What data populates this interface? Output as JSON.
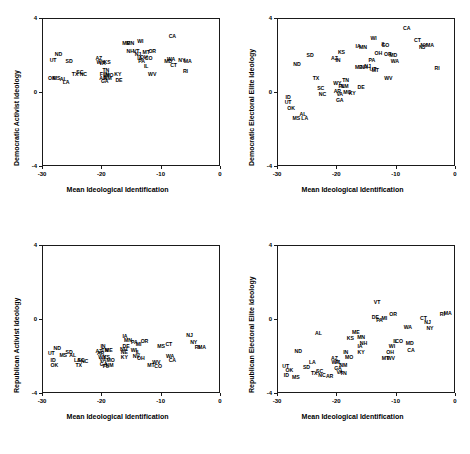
{
  "figure": {
    "panel_count": 4,
    "shared_xlabel": "Mean Ideological Identification",
    "xticks": [
      "-30",
      "-20",
      "-10",
      "0"
    ],
    "yticks": [
      "4",
      "0",
      "-4"
    ]
  },
  "chart_data": [
    {
      "id": "panel-top-left",
      "type": "scatter",
      "title": "",
      "xlabel": "Mean Ideological Identification",
      "ylabel": "Democratic Activist Ideology",
      "xlim": [
        -30,
        0
      ],
      "ylim": [
        -4,
        4
      ],
      "xticks": [
        -30,
        -20,
        -10,
        0
      ],
      "yticks": [
        4,
        0,
        -4
      ],
      "grid": false,
      "legend": "none",
      "point_labels": "state abbreviations",
      "points": [
        {
          "label": "UT",
          "x": -28.3,
          "y": 1.75
        },
        {
          "label": "ND",
          "x": -27.4,
          "y": 2.05
        },
        {
          "label": "SD",
          "x": -25.6,
          "y": 1.65
        },
        {
          "label": "OK",
          "x": -28.5,
          "y": 0.75
        },
        {
          "label": "MS",
          "x": -27.7,
          "y": 0.75
        },
        {
          "label": "AL",
          "x": -26.6,
          "y": 0.7
        },
        {
          "label": "LA",
          "x": -26.1,
          "y": 0.55
        },
        {
          "label": "TX",
          "x": -24.6,
          "y": 0.95
        },
        {
          "label": "SC",
          "x": -23.8,
          "y": 1.1
        },
        {
          "label": "NC",
          "x": -23.2,
          "y": 0.95
        },
        {
          "label": "AZ",
          "x": -20.6,
          "y": 1.85
        },
        {
          "label": "WY",
          "x": -20.3,
          "y": 1.6
        },
        {
          "label": "VA",
          "x": -20.0,
          "y": 1.55
        },
        {
          "label": "KS",
          "x": -19.2,
          "y": 1.6
        },
        {
          "label": "TN",
          "x": -19.4,
          "y": 1.2
        },
        {
          "label": "FL",
          "x": -19.9,
          "y": 1.0
        },
        {
          "label": "IN",
          "x": -19.3,
          "y": 0.95
        },
        {
          "label": "MO",
          "x": -18.8,
          "y": 0.9
        },
        {
          "label": "AR",
          "x": -19.9,
          "y": 0.75
        },
        {
          "label": "NM",
          "x": -19.1,
          "y": 0.75
        },
        {
          "label": "GA",
          "x": -19.6,
          "y": 0.6
        },
        {
          "label": "KY",
          "x": -17.4,
          "y": 0.95
        },
        {
          "label": "DE",
          "x": -17.2,
          "y": 0.65
        },
        {
          "label": "ME",
          "x": -16.0,
          "y": 2.65
        },
        {
          "label": "MN",
          "x": -15.3,
          "y": 2.65
        },
        {
          "label": "WI",
          "x": -13.6,
          "y": 2.75
        },
        {
          "label": "NH",
          "x": -15.3,
          "y": 2.2
        },
        {
          "label": "VT",
          "x": -14.3,
          "y": 2.2
        },
        {
          "label": "NJ",
          "x": -14.0,
          "y": 2.05
        },
        {
          "label": "IA",
          "x": -13.7,
          "y": 1.85
        },
        {
          "label": "PA",
          "x": -13.4,
          "y": 1.7
        },
        {
          "label": "MT",
          "x": -12.6,
          "y": 2.15
        },
        {
          "label": "OH",
          "x": -13.0,
          "y": 1.9
        },
        {
          "label": "CO",
          "x": -12.2,
          "y": 1.85
        },
        {
          "label": "IL",
          "x": -12.6,
          "y": 1.4
        },
        {
          "label": "OR",
          "x": -11.6,
          "y": 2.2
        },
        {
          "label": "WV",
          "x": -11.6,
          "y": 0.95
        },
        {
          "label": "CA",
          "x": -8.2,
          "y": 3.05
        },
        {
          "label": "WA",
          "x": -8.4,
          "y": 1.8
        },
        {
          "label": "MD",
          "x": -8.9,
          "y": 1.7
        },
        {
          "label": "CT",
          "x": -8.0,
          "y": 1.45
        },
        {
          "label": "NY",
          "x": -6.6,
          "y": 1.75
        },
        {
          "label": "MA",
          "x": -5.6,
          "y": 1.7
        },
        {
          "label": "RI",
          "x": -6.0,
          "y": 1.15
        }
      ]
    },
    {
      "id": "panel-top-right",
      "type": "scatter",
      "title": "",
      "xlabel": "Mean Ideological Identification",
      "ylabel": "Democratic Electoral Elite Ideology",
      "xlim": [
        -30,
        0
      ],
      "ylim": [
        -4,
        4
      ],
      "xticks": [
        -30,
        -20,
        -10,
        0
      ],
      "yticks": [
        4,
        0,
        -4
      ],
      "grid": false,
      "legend": "none",
      "point_labels": "state abbreviations",
      "points": [
        {
          "label": "ID",
          "x": -28.3,
          "y": -0.25
        },
        {
          "label": "UT",
          "x": -28.3,
          "y": -0.55
        },
        {
          "label": "OK",
          "x": -27.8,
          "y": -0.85
        },
        {
          "label": "MS",
          "x": -26.9,
          "y": -1.4
        },
        {
          "label": "AL",
          "x": -25.8,
          "y": -1.2
        },
        {
          "label": "LA",
          "x": -25.5,
          "y": -1.4
        },
        {
          "label": "ND",
          "x": -26.8,
          "y": 1.5
        },
        {
          "label": "SD",
          "x": -24.6,
          "y": 2.0
        },
        {
          "label": "TX",
          "x": -23.6,
          "y": 0.75
        },
        {
          "label": "SC",
          "x": -22.8,
          "y": 0.2
        },
        {
          "label": "NC",
          "x": -22.5,
          "y": -0.1
        },
        {
          "label": "AZ",
          "x": -20.5,
          "y": 1.85
        },
        {
          "label": "IN",
          "x": -19.9,
          "y": 1.75
        },
        {
          "label": "KS",
          "x": -19.3,
          "y": 2.15
        },
        {
          "label": "WY",
          "x": -20.0,
          "y": 0.5
        },
        {
          "label": "AR",
          "x": -20.0,
          "y": 0.05
        },
        {
          "label": "VA",
          "x": -19.6,
          "y": -0.1
        },
        {
          "label": "GA",
          "x": -19.6,
          "y": -0.45
        },
        {
          "label": "FL",
          "x": -19.3,
          "y": 0.3
        },
        {
          "label": "NM",
          "x": -18.8,
          "y": 0.3
        },
        {
          "label": "TN",
          "x": -18.6,
          "y": 0.65
        },
        {
          "label": "MO",
          "x": -18.3,
          "y": 0.0
        },
        {
          "label": "KY",
          "x": -17.5,
          "y": -0.05
        },
        {
          "label": "IA",
          "x": -16.5,
          "y": 2.5
        },
        {
          "label": "MN",
          "x": -15.7,
          "y": 2.45
        },
        {
          "label": "ME",
          "x": -16.4,
          "y": 1.35
        },
        {
          "label": "NH",
          "x": -15.5,
          "y": 1.35
        },
        {
          "label": "NJ",
          "x": -14.9,
          "y": 1.4
        },
        {
          "label": "DE",
          "x": -16.0,
          "y": 0.25
        },
        {
          "label": "WI",
          "x": -13.9,
          "y": 2.9
        },
        {
          "label": "PA",
          "x": -14.2,
          "y": 1.75
        },
        {
          "label": "UT2",
          "x": -14.0,
          "y": 1.25
        },
        {
          "label": "MT",
          "x": -13.6,
          "y": 1.2
        },
        {
          "label": "OH",
          "x": -13.1,
          "y": 2.1
        },
        {
          "label": "IL",
          "x": -12.2,
          "y": 2.6
        },
        {
          "label": "CO",
          "x": -11.9,
          "y": 2.55
        },
        {
          "label": "OR",
          "x": -11.5,
          "y": 2.05
        },
        {
          "label": "MD",
          "x": -10.6,
          "y": 2.0
        },
        {
          "label": "WA",
          "x": -10.3,
          "y": 1.65
        },
        {
          "label": "WV",
          "x": -11.4,
          "y": 0.75
        },
        {
          "label": "CA",
          "x": -8.3,
          "y": 3.45
        },
        {
          "label": "CT",
          "x": -6.5,
          "y": 2.8
        },
        {
          "label": "NJ2",
          "x": -5.7,
          "y": 2.45
        },
        {
          "label": "NY",
          "x": -5.4,
          "y": 2.55
        },
        {
          "label": "MA",
          "x": -4.4,
          "y": 2.55
        },
        {
          "label": "RI",
          "x": -3.2,
          "y": 1.3
        }
      ]
    },
    {
      "id": "panel-bottom-left",
      "type": "scatter",
      "title": "",
      "xlabel": "Mean Ideological Identification",
      "ylabel": "Republican Activist Ideology",
      "xlim": [
        -30,
        0
      ],
      "ylim": [
        -4,
        4
      ],
      "xticks": [
        -30,
        -20,
        -10,
        0
      ],
      "yticks": [
        4,
        0,
        -4
      ],
      "grid": false,
      "legend": "none",
      "point_labels": "state abbreviations",
      "points": [
        {
          "label": "UT",
          "x": -28.6,
          "y": -1.85
        },
        {
          "label": "ND",
          "x": -27.6,
          "y": -1.55
        },
        {
          "label": "ID",
          "x": -28.3,
          "y": -2.2
        },
        {
          "label": "OK",
          "x": -28.1,
          "y": -2.5
        },
        {
          "label": "MS",
          "x": -26.6,
          "y": -1.95
        },
        {
          "label": "SD",
          "x": -25.6,
          "y": -1.8
        },
        {
          "label": "AL",
          "x": -25.0,
          "y": -1.95
        },
        {
          "label": "LA",
          "x": -24.2,
          "y": -2.2
        },
        {
          "label": "SC",
          "x": -23.6,
          "y": -2.2
        },
        {
          "label": "NC",
          "x": -23.0,
          "y": -2.25
        },
        {
          "label": "TX",
          "x": -24.0,
          "y": -2.5
        },
        {
          "label": "AZ",
          "x": -20.6,
          "y": -1.75
        },
        {
          "label": "IN",
          "x": -19.9,
          "y": -1.45
        },
        {
          "label": "TN",
          "x": -19.6,
          "y": -1.7
        },
        {
          "label": "AR",
          "x": -20.3,
          "y": -1.85
        },
        {
          "label": "ME",
          "x": -18.9,
          "y": -1.7
        },
        {
          "label": "WY",
          "x": -20.0,
          "y": -2.05
        },
        {
          "label": "KS",
          "x": -19.3,
          "y": -2.05
        },
        {
          "label": "VA",
          "x": -19.9,
          "y": -2.2
        },
        {
          "label": "GA",
          "x": -19.8,
          "y": -2.45
        },
        {
          "label": "FL",
          "x": -19.4,
          "y": -2.55
        },
        {
          "label": "NM",
          "x": -18.8,
          "y": -2.5
        },
        {
          "label": "MO",
          "x": -18.6,
          "y": -2.2
        },
        {
          "label": "IA",
          "x": -16.2,
          "y": -0.9
        },
        {
          "label": "MN",
          "x": -15.7,
          "y": -1.15
        },
        {
          "label": "NH",
          "x": -16.4,
          "y": -1.6
        },
        {
          "label": "DE",
          "x": -16.0,
          "y": -1.45
        },
        {
          "label": "NE",
          "x": -16.3,
          "y": -1.8
        },
        {
          "label": "KY",
          "x": -16.3,
          "y": -2.05
        },
        {
          "label": "PA",
          "x": -14.6,
          "y": -1.25
        },
        {
          "label": "MI",
          "x": -13.9,
          "y": -1.35
        },
        {
          "label": "WI",
          "x": -14.7,
          "y": -1.7
        },
        {
          "label": "IL",
          "x": -14.0,
          "y": -1.8
        },
        {
          "label": "NV",
          "x": -14.3,
          "y": -2.0
        },
        {
          "label": "OH",
          "x": -13.5,
          "y": -2.1
        },
        {
          "label": "OR",
          "x": -12.9,
          "y": -1.2
        },
        {
          "label": "MT",
          "x": -11.8,
          "y": -2.5
        },
        {
          "label": "WV",
          "x": -10.9,
          "y": -2.3
        },
        {
          "label": "CO",
          "x": -10.6,
          "y": -2.55
        },
        {
          "label": "MS2",
          "x": -10.1,
          "y": -1.45
        },
        {
          "label": "CT",
          "x": -8.8,
          "y": -1.35
        },
        {
          "label": "WA",
          "x": -8.6,
          "y": -2.0
        },
        {
          "label": "CA",
          "x": -8.2,
          "y": -2.2
        },
        {
          "label": "NJ",
          "x": -5.3,
          "y": -0.85
        },
        {
          "label": "NY",
          "x": -4.6,
          "y": -1.25
        },
        {
          "label": "RI",
          "x": -4.0,
          "y": -1.5
        },
        {
          "label": "MA",
          "x": -3.2,
          "y": -1.5
        }
      ]
    },
    {
      "id": "panel-bottom-right",
      "type": "scatter",
      "title": "",
      "xlabel": "Mean Ideological Identification",
      "ylabel": "Republican Electoral Elite Ideology",
      "xlim": [
        -30,
        0
      ],
      "ylim": [
        -4,
        4
      ],
      "xticks": [
        -30,
        -20,
        -10,
        0
      ],
      "yticks": [
        4,
        0,
        -4
      ],
      "grid": false,
      "legend": "none",
      "point_labels": "state abbreviations",
      "points": [
        {
          "label": "UT",
          "x": -28.7,
          "y": -2.55
        },
        {
          "label": "OK",
          "x": -28.1,
          "y": -2.75
        },
        {
          "label": "ID",
          "x": -28.6,
          "y": -3.05
        },
        {
          "label": "MS",
          "x": -27.0,
          "y": -3.15
        },
        {
          "label": "ND",
          "x": -26.6,
          "y": -1.75
        },
        {
          "label": "SD",
          "x": -25.2,
          "y": -2.6
        },
        {
          "label": "LA",
          "x": -24.2,
          "y": -2.3
        },
        {
          "label": "AL",
          "x": -23.2,
          "y": -0.75
        },
        {
          "label": "TX",
          "x": -23.9,
          "y": -2.9
        },
        {
          "label": "SC",
          "x": -23.0,
          "y": -2.8
        },
        {
          "label": "NC",
          "x": -22.6,
          "y": -3.05
        },
        {
          "label": "AR",
          "x": -21.3,
          "y": -3.1
        },
        {
          "label": "AZ",
          "x": -20.5,
          "y": -2.1
        },
        {
          "label": "WY",
          "x": -20.3,
          "y": -2.35
        },
        {
          "label": "FL",
          "x": -19.8,
          "y": -2.3
        },
        {
          "label": "GA",
          "x": -19.9,
          "y": -2.65
        },
        {
          "label": "VA",
          "x": -19.6,
          "y": -2.85
        },
        {
          "label": "TN",
          "x": -19.0,
          "y": -2.9
        },
        {
          "label": "NM",
          "x": -19.0,
          "y": -2.5
        },
        {
          "label": "IN",
          "x": -18.6,
          "y": -1.8
        },
        {
          "label": "MO",
          "x": -18.0,
          "y": -2.05
        },
        {
          "label": "KS",
          "x": -17.8,
          "y": -1.0
        },
        {
          "label": "ME",
          "x": -16.9,
          "y": -0.7
        },
        {
          "label": "MN",
          "x": -16.0,
          "y": -0.95
        },
        {
          "label": "NH",
          "x": -15.6,
          "y": -1.3
        },
        {
          "label": "IA",
          "x": -16.2,
          "y": -1.45
        },
        {
          "label": "KY",
          "x": -16.0,
          "y": -1.8
        },
        {
          "label": "VT",
          "x": -13.3,
          "y": 0.9
        },
        {
          "label": "DE",
          "x": -13.6,
          "y": 0.1
        },
        {
          "label": "PA",
          "x": -12.9,
          "y": -0.05
        },
        {
          "label": "MI",
          "x": -12.1,
          "y": 0.05
        },
        {
          "label": "MT",
          "x": -11.9,
          "y": -2.1
        },
        {
          "label": "WV",
          "x": -11.0,
          "y": -2.1
        },
        {
          "label": "OH",
          "x": -11.1,
          "y": -1.8
        },
        {
          "label": "WI",
          "x": -10.8,
          "y": -1.45
        },
        {
          "label": "IL",
          "x": -10.2,
          "y": -1.2
        },
        {
          "label": "CO",
          "x": -9.6,
          "y": -1.2
        },
        {
          "label": "OR",
          "x": -10.6,
          "y": 0.25
        },
        {
          "label": "WA",
          "x": -8.1,
          "y": -0.45
        },
        {
          "label": "MD",
          "x": -7.8,
          "y": -1.3
        },
        {
          "label": "CA",
          "x": -7.6,
          "y": -1.7
        },
        {
          "label": "CT",
          "x": -5.5,
          "y": 0.05
        },
        {
          "label": "NJ",
          "x": -4.8,
          "y": -0.15
        },
        {
          "label": "NY",
          "x": -4.4,
          "y": -0.5
        },
        {
          "label": "RI",
          "x": -2.3,
          "y": 0.25
        },
        {
          "label": "MA",
          "x": -1.4,
          "y": 0.3
        }
      ]
    }
  ]
}
